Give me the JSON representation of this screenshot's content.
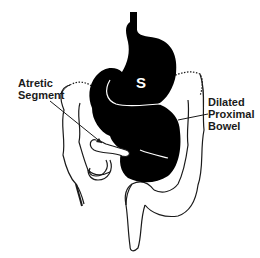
{
  "figure": {
    "type": "anatomical-diagram",
    "colors": {
      "bowel_fill": "#000000",
      "outline": "#1a1a1a",
      "background": "#ffffff"
    }
  },
  "labels": {
    "stomach": "S",
    "atretic_line1": "Atretic",
    "atretic_line2": "Segment",
    "dilated_line1": "Dilated",
    "dilated_line2": "Proximal",
    "dilated_line3": "Bowel"
  }
}
